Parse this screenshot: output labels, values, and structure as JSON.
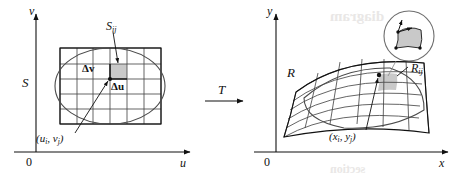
{
  "figure": {
    "type": "math-diagram",
    "background_color": "#ffffff",
    "ink_color": "#111111",
    "shade_color": "#c9c9c9"
  },
  "left_panel": {
    "name": "uv-plane",
    "axis_vertical_label": "v",
    "axis_horizontal_label": "u",
    "origin_label": "0",
    "region_label": "S",
    "subrectangle_label": "S",
    "subrectangle_sub": "ij",
    "delta_v_label": "Δv",
    "delta_u_label": "Δu",
    "corner_point_label": "(u",
    "corner_point_sub_i": "i",
    "corner_point_mid": ", v",
    "corner_point_sub_j": "j",
    "corner_point_end": ")",
    "grid_columns": 6,
    "grid_rows": 5
  },
  "transform": {
    "label": "T",
    "arrow": "right-arrow"
  },
  "right_panel": {
    "name": "xy-plane",
    "axis_vertical_label": "y",
    "axis_horizontal_label": "x",
    "origin_label": "0",
    "region_label": "R",
    "subregion_label": "R",
    "subregion_sub": "ij",
    "image_point_label": "(x",
    "image_point_sub_i": "i",
    "image_point_mid": ", y",
    "image_point_sub_j": "j",
    "image_point_end": ")",
    "magnifier": "circular-inset-detail",
    "grid_columns": 6,
    "grid_rows": 5
  },
  "bleed_through": {
    "text_top": "diagram",
    "text_bottom": "section"
  }
}
